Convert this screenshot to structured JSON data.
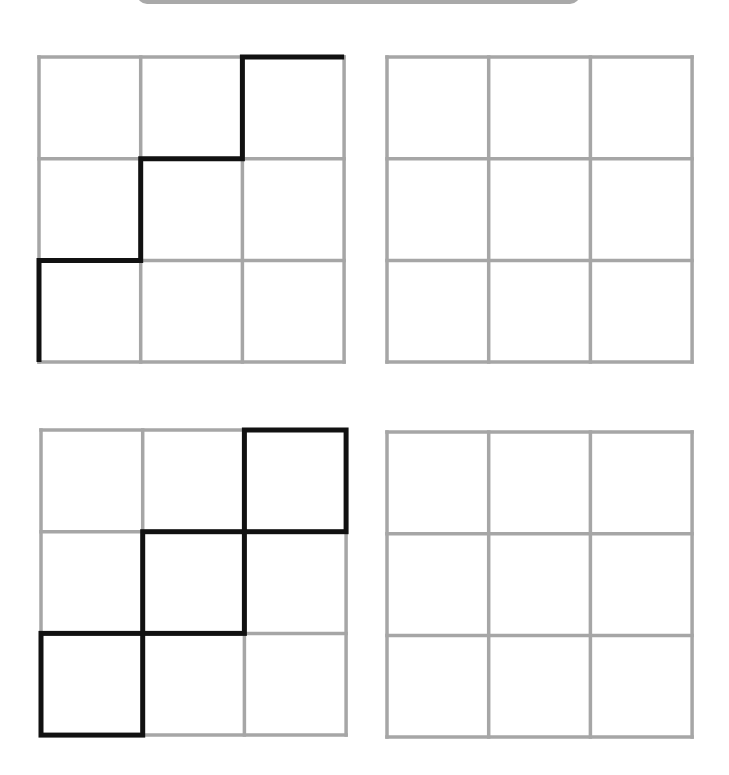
{
  "banner": {
    "color": "#a9a9a9"
  },
  "colors": {
    "grid_line": "#a6a6a6",
    "path_line": "#111111",
    "background": "#ffffff"
  },
  "grid": {
    "rows": 3,
    "cols": 3,
    "cell_size": 101.7
  },
  "panels": [
    {
      "id": "top-left",
      "position": {
        "left": 37,
        "top": 55
      },
      "highlight_type": "staircase-path",
      "path_points": [
        [
          0,
          3
        ],
        [
          0,
          2
        ],
        [
          1,
          2
        ],
        [
          1,
          1
        ],
        [
          2,
          1
        ],
        [
          2,
          0
        ],
        [
          3,
          0
        ]
      ]
    },
    {
      "id": "top-right",
      "position": {
        "left": 385,
        "top": 55
      },
      "highlight_type": "empty"
    },
    {
      "id": "bottom-left",
      "position": {
        "left": 39,
        "top": 428
      },
      "highlight_type": "diagonal-squares",
      "highlighted_cells": [
        {
          "col": 0,
          "row": 2
        },
        {
          "col": 1,
          "row": 1
        },
        {
          "col": 2,
          "row": 0
        }
      ]
    },
    {
      "id": "bottom-right",
      "position": {
        "left": 385,
        "top": 430
      },
      "highlight_type": "empty"
    }
  ]
}
